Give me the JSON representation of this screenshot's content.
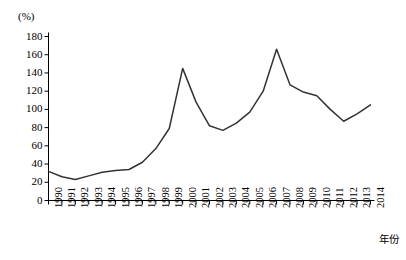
{
  "chart_data": {
    "type": "line",
    "title": "",
    "subtitle": "",
    "xlabel": "年份",
    "ylabel": "(%)",
    "ylim": [
      0,
      180
    ],
    "xlim": [
      1990,
      2014
    ],
    "grid": false,
    "legend": null,
    "y_ticks": [
      "0",
      "20",
      "40",
      "60",
      "80",
      "100",
      "120",
      "140",
      "160",
      "180"
    ],
    "y_tick_values": [
      0,
      20,
      40,
      60,
      80,
      100,
      120,
      140,
      160,
      180
    ],
    "categories": [
      "1990",
      "1991",
      "1992",
      "1993",
      "1994",
      "1995",
      "1996",
      "1997",
      "1998",
      "1999",
      "2000",
      "2001",
      "2002",
      "2003",
      "2004",
      "2005",
      "2006",
      "2007",
      "2008",
      "2009",
      "2010",
      "2011",
      "2012",
      "2013",
      "2014"
    ],
    "values": [
      32,
      26,
      23,
      27,
      31,
      33,
      34,
      42,
      57,
      79,
      145,
      108,
      82,
      77,
      85,
      97,
      120,
      166,
      127,
      119,
      115,
      100,
      87,
      95,
      105
    ],
    "series": [
      {
        "name": "",
        "color": "#333333",
        "values": [
          32,
          26,
          23,
          27,
          31,
          33,
          34,
          42,
          57,
          79,
          145,
          108,
          82,
          77,
          85,
          97,
          120,
          166,
          127,
          119,
          115,
          100,
          87,
          95,
          105
        ]
      }
    ],
    "annotations": []
  },
  "axis": {
    "y_unit": "(%)",
    "x_title": "年份"
  }
}
